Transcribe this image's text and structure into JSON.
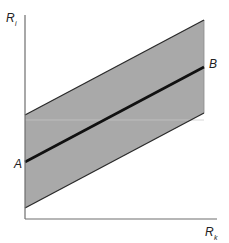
{
  "diagram": {
    "type": "band-around-line",
    "axes": {
      "y_label": {
        "main": "R",
        "sub": "i"
      },
      "x_label": {
        "main": "R",
        "sub": "k"
      }
    },
    "points": {
      "A": {
        "label": "A"
      },
      "B": {
        "label": "B"
      }
    },
    "geometry": {
      "origin": [
        25,
        219
      ],
      "y_axis_top": [
        25,
        15
      ],
      "x_axis_right": [
        217,
        219
      ],
      "band_right_x": 204,
      "upper_edge": [
        [
          25,
          115
        ],
        [
          204,
          20
        ]
      ],
      "center_line": [
        [
          25,
          162
        ],
        [
          204,
          67
        ]
      ],
      "lower_edge": [
        [
          25,
          208
        ],
        [
          204,
          113
        ]
      ]
    },
    "colors": {
      "band_fill": "#a9a9a9",
      "axis": "#6e6e6e",
      "edge": "#2a2a2a",
      "center_line": "#111111",
      "artifact_line": "#c8c8c8"
    }
  }
}
